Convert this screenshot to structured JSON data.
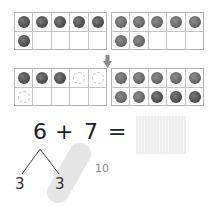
{
  "ten_frames": [
    {
      "id": "frame-a",
      "cells": [
        "dark",
        "dark",
        "dark",
        "dark",
        "dark",
        "dark",
        "empty",
        "empty",
        "empty",
        "empty"
      ],
      "count": 6
    },
    {
      "id": "frame-b",
      "cells": [
        "med",
        "med",
        "med",
        "med",
        "med",
        "med",
        "med",
        "empty",
        "empty",
        "empty"
      ],
      "count": 7
    },
    {
      "id": "frame-c",
      "cells": [
        "dark",
        "dark",
        "dark",
        "ghost",
        "ghost",
        "ghost",
        "empty",
        "empty",
        "empty",
        "empty"
      ],
      "count": 3
    },
    {
      "id": "frame-d",
      "cells": [
        "med",
        "med",
        "med",
        "med",
        "med",
        "med",
        "med",
        "dark",
        "dark",
        "dark"
      ],
      "count": 10
    }
  ],
  "equation": {
    "left": "6",
    "operator": "+",
    "right": "7",
    "equals": "=",
    "answer": ""
  },
  "decomposition": {
    "part_a": "3",
    "part_b": "3",
    "make_ten_label": "10"
  },
  "icons": {
    "arrow": "arrow-down-icon"
  },
  "colors": {
    "counter_dark": "#555555",
    "counter_med": "#6e6e6e",
    "grid_line": "#c4c4c4",
    "highlight": "#e6e6e6"
  }
}
